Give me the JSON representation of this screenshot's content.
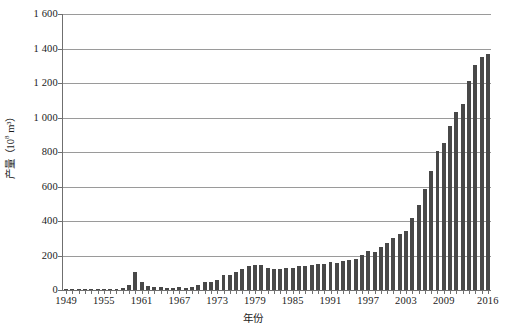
{
  "chart_data": {
    "type": "bar",
    "title": "",
    "subtitle": "",
    "xlabel": "年份",
    "ylabel": "产量（10⁸ m³）",
    "ylabel_base": "产量（10",
    "ylabel_exp": "8",
    "ylabel_tail": " m³）",
    "ylim": [
      0,
      1600
    ],
    "ytick_step": 200,
    "grid": true,
    "legend": false,
    "legend_position": "none",
    "bar_color": "#484848",
    "grid_color": "#9a9a9a",
    "axis_color": "#6f6f6f",
    "ytick_labels": [
      "1 600",
      "1 400",
      "1 200",
      "1 000",
      "800",
      "600",
      "400",
      "200",
      "0"
    ],
    "ytick_values": [
      1600,
      1400,
      1200,
      1000,
      800,
      600,
      400,
      200,
      0
    ],
    "xtick_labels": [
      "1949",
      "1955",
      "1961",
      "1967",
      "1973",
      "1979",
      "1985",
      "1991",
      "1997",
      "2003",
      "2009",
      "2016"
    ],
    "xtick_years": [
      1949,
      1955,
      1961,
      1967,
      1973,
      1979,
      1985,
      1991,
      1997,
      2003,
      2009,
      2016
    ],
    "categories": [
      "1949",
      "1950",
      "1951",
      "1952",
      "1953",
      "1954",
      "1955",
      "1956",
      "1957",
      "1958",
      "1959",
      "1960",
      "1961",
      "1962",
      "1963",
      "1964",
      "1965",
      "1966",
      "1967",
      "1968",
      "1969",
      "1970",
      "1971",
      "1972",
      "1973",
      "1974",
      "1975",
      "1976",
      "1977",
      "1978",
      "1979",
      "1980",
      "1981",
      "1982",
      "1983",
      "1984",
      "1985",
      "1986",
      "1987",
      "1988",
      "1989",
      "1990",
      "1991",
      "1992",
      "1993",
      "1994",
      "1995",
      "1996",
      "1997",
      "1998",
      "1999",
      "2000",
      "2001",
      "2002",
      "2003",
      "2004",
      "2005",
      "2006",
      "2007",
      "2008",
      "2009",
      "2010",
      "2011",
      "2012",
      "2013",
      "2014",
      "2015",
      "2016"
    ],
    "values": [
      1,
      1,
      1,
      1,
      1,
      2,
      2,
      2,
      3,
      11,
      27,
      104,
      47,
      24,
      17,
      15,
      11,
      13,
      15,
      14,
      19,
      29,
      48,
      48,
      59,
      87,
      88,
      102,
      121,
      137,
      145,
      143,
      127,
      119,
      122,
      125,
      129,
      137,
      139,
      143,
      150,
      153,
      160,
      158,
      167,
      175,
      179,
      201,
      227,
      223,
      252,
      272,
      303,
      327,
      341,
      415,
      493,
      586,
      692,
      803,
      853,
      948,
      1031,
      1077,
      1209,
      1302,
      1350,
      1371
    ]
  }
}
